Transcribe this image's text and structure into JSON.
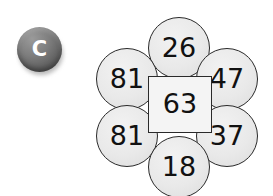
{
  "canvas": {
    "width": 273,
    "height": 196,
    "background": "#ffffff"
  },
  "badge": {
    "icon_name": "letter-c-badge-icon",
    "letter": "C",
    "fill_color": "#6f6f6f",
    "letter_color": "#ffffff"
  },
  "diagram": {
    "type": "petal-number-diagram",
    "center": {
      "label": "center-value",
      "value": "63",
      "shape": "square",
      "fill": "#f4f4f4",
      "stroke": "#2a2a2a"
    },
    "petals": [
      {
        "position": "top",
        "value": "26"
      },
      {
        "position": "upper-left",
        "value": "81"
      },
      {
        "position": "upper-right",
        "value": "47"
      },
      {
        "position": "lower-left",
        "value": "81"
      },
      {
        "position": "lower-right",
        "value": "37"
      },
      {
        "position": "bottom",
        "value": "18"
      }
    ],
    "petal_fill": "#e9e9e9",
    "petal_stroke": "#2a2a2a",
    "text_color": "#111111"
  }
}
